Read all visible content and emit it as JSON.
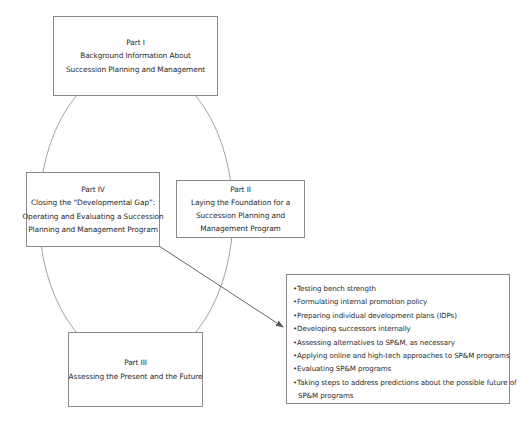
{
  "parts": {
    "part1": {
      "title": "Part I",
      "lines": [
        "Background Information About",
        "Succession Planning and Management"
      ]
    },
    "part2": {
      "title": "Part II",
      "lines": [
        "Laying the Foundation for a",
        "Succession Planning and",
        "Management Program"
      ]
    },
    "part3": {
      "title": "Part III",
      "lines": [
        "Assessing the Present and the Future"
      ]
    },
    "part4": {
      "title": "Part IV",
      "lines": [
        "Closing the “Developmental Gap”:",
        "Operating and Evaluating a Succession",
        "Planning and Management Program"
      ]
    }
  },
  "bullet_box": {
    "bullet_glyph": "•",
    "items": [
      "Testing bench strength",
      "Formulating internal promotion policy",
      "Preparing individual development plans (IDPs)",
      "Developing successors internally",
      "Assessing alternatives to SP&M, as necessary",
      "Applying online and high-tech approaches to SP&M programs",
      "Evaluating SP&M programs",
      "Taking steps to address predictions about the possible future of"
    ],
    "continuation": "SP&M programs"
  },
  "colors": {
    "line": "#8a8a8a",
    "arrow": "#555555",
    "text": "#2a2a2a"
  }
}
